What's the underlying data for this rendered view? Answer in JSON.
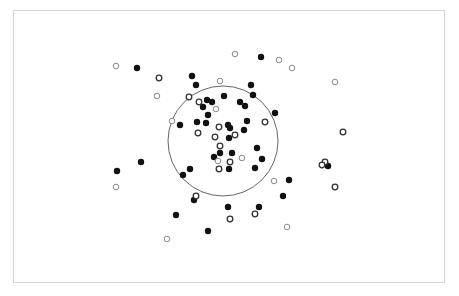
{
  "chart_data": {
    "type": "scatter",
    "title": "",
    "xlabel": "",
    "ylabel": "",
    "grid": false,
    "legend": null,
    "frame": {
      "x": 13,
      "y": 10,
      "width": 432,
      "height": 273,
      "color": "#d6d6d6"
    },
    "reference_circle": {
      "cx": 223,
      "cy": 141,
      "r": 55,
      "stroke": "#666666"
    },
    "marker_radius": 3.2,
    "colors": {
      "filled": "#111111",
      "open_dark": "#333333",
      "open_light": "#8a8a8a"
    },
    "series": [
      {
        "name": "filled",
        "style": "filled",
        "points": [
          [
            137,
            68
          ],
          [
            192,
            76
          ],
          [
            196,
            85
          ],
          [
            261,
            57
          ],
          [
            251,
            85
          ],
          [
            253,
            95
          ],
          [
            207,
            100
          ],
          [
            203,
            107
          ],
          [
            212,
            102
          ],
          [
            224,
            96
          ],
          [
            240,
            102
          ],
          [
            245,
            106
          ],
          [
            208,
            115
          ],
          [
            180,
            125
          ],
          [
            197,
            122
          ],
          [
            206,
            123
          ],
          [
            228,
            125
          ],
          [
            230,
            128
          ],
          [
            229,
            138
          ],
          [
            247,
            121
          ],
          [
            244,
            130
          ],
          [
            275,
            113
          ],
          [
            257,
            148
          ],
          [
            262,
            159
          ],
          [
            255,
            168
          ],
          [
            214,
            157
          ],
          [
            220,
            153
          ],
          [
            232,
            153
          ],
          [
            229,
            169
          ],
          [
            190,
            169
          ],
          [
            183,
            175
          ],
          [
            141,
            162
          ],
          [
            117,
            171
          ],
          [
            289,
            180
          ],
          [
            283,
            196
          ],
          [
            194,
            200
          ],
          [
            228,
            207
          ],
          [
            259,
            207
          ],
          [
            176,
            215
          ],
          [
            208,
            231
          ],
          [
            328,
            166
          ]
        ]
      },
      {
        "name": "open_dark",
        "style": "open",
        "points": [
          [
            159,
            78
          ],
          [
            189,
            97
          ],
          [
            199,
            102
          ],
          [
            219,
            127
          ],
          [
            198,
            133
          ],
          [
            215,
            137
          ],
          [
            235,
            135
          ],
          [
            220,
            146
          ],
          [
            230,
            162
          ],
          [
            219,
            169
          ],
          [
            265,
            122
          ],
          [
            343,
            132
          ],
          [
            196,
            196
          ],
          [
            230,
            219
          ],
          [
            255,
            214
          ],
          [
            335,
            187
          ],
          [
            325,
            162
          ],
          [
            322,
            165
          ]
        ]
      },
      {
        "name": "open_light",
        "style": "open",
        "points": [
          [
            116,
            66
          ],
          [
            157,
            96
          ],
          [
            172,
            121
          ],
          [
            220,
            81
          ],
          [
            235,
            54
          ],
          [
            279,
            60
          ],
          [
            292,
            68
          ],
          [
            335,
            82
          ],
          [
            216,
            109
          ],
          [
            218,
            161
          ],
          [
            242,
            158
          ],
          [
            274,
            181
          ],
          [
            116,
            187
          ],
          [
            287,
            227
          ],
          [
            167,
            239
          ]
        ]
      }
    ]
  }
}
